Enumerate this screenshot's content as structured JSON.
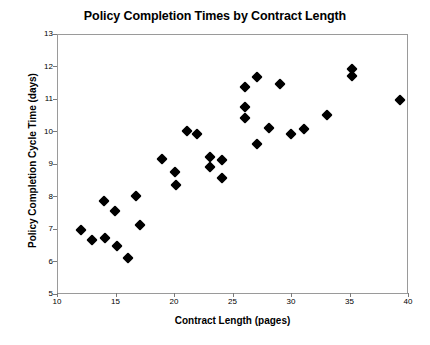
{
  "chart_data": {
    "type": "scatter",
    "title": "Policy Completion Times by Contract Length",
    "xlabel": "Contract Length (pages)",
    "ylabel": "Policy Completion Cycle Time (days)",
    "xlim": [
      10,
      40
    ],
    "ylim": [
      5,
      13
    ],
    "xticks": [
      10,
      15,
      20,
      25,
      30,
      35,
      40
    ],
    "yticks": [
      5,
      6,
      7,
      8,
      9,
      10,
      11,
      12,
      13
    ],
    "grid": false,
    "legend": null,
    "marker": "filled-diamond",
    "marker_color": "#000000",
    "points": [
      {
        "x": 12.0,
        "y": 7.0
      },
      {
        "x": 12.9,
        "y": 6.7
      },
      {
        "x": 13.9,
        "y": 7.9
      },
      {
        "x": 14.0,
        "y": 6.75
      },
      {
        "x": 14.9,
        "y": 7.6
      },
      {
        "x": 15.0,
        "y": 6.5
      },
      {
        "x": 16.0,
        "y": 6.15
      },
      {
        "x": 16.7,
        "y": 8.05
      },
      {
        "x": 17.0,
        "y": 7.15
      },
      {
        "x": 18.9,
        "y": 9.2
      },
      {
        "x": 20.0,
        "y": 8.8
      },
      {
        "x": 20.1,
        "y": 8.4
      },
      {
        "x": 21.0,
        "y": 10.05
      },
      {
        "x": 21.9,
        "y": 9.95
      },
      {
        "x": 23.0,
        "y": 9.25
      },
      {
        "x": 23.0,
        "y": 8.95
      },
      {
        "x": 24.0,
        "y": 9.15
      },
      {
        "x": 24.0,
        "y": 8.6
      },
      {
        "x": 26.0,
        "y": 11.4
      },
      {
        "x": 26.0,
        "y": 10.8
      },
      {
        "x": 26.0,
        "y": 10.45
      },
      {
        "x": 27.0,
        "y": 11.7
      },
      {
        "x": 27.0,
        "y": 9.65
      },
      {
        "x": 28.0,
        "y": 10.15
      },
      {
        "x": 29.0,
        "y": 11.5
      },
      {
        "x": 29.9,
        "y": 9.95
      },
      {
        "x": 31.0,
        "y": 10.1
      },
      {
        "x": 33.0,
        "y": 10.55
      },
      {
        "x": 35.1,
        "y": 11.95
      },
      {
        "x": 35.1,
        "y": 11.75
      },
      {
        "x": 39.2,
        "y": 11.0
      }
    ]
  }
}
